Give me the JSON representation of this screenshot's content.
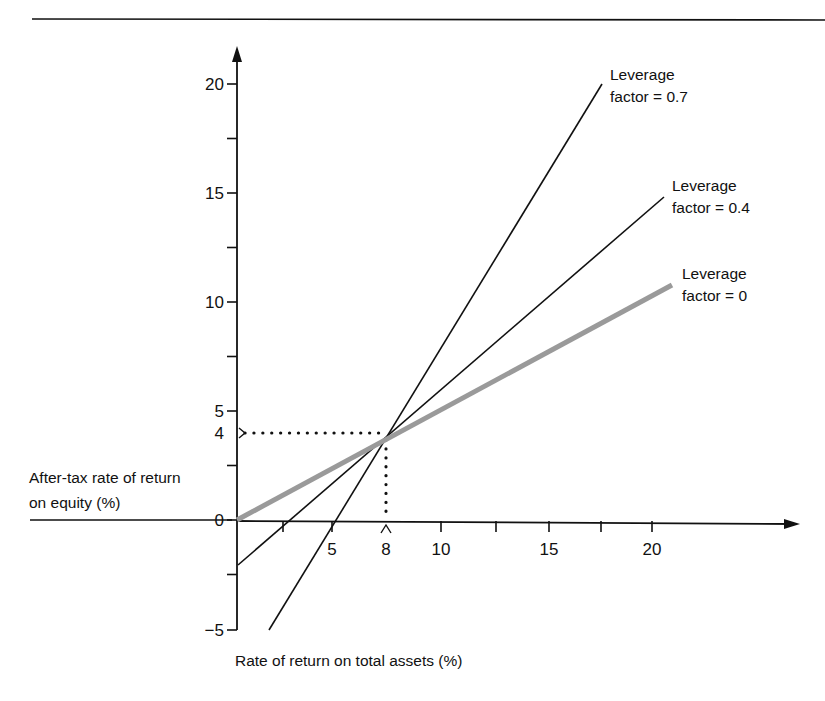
{
  "chart_data": {
    "type": "line",
    "title": "",
    "xlabel": "Rate of return on total assets (%)",
    "ylabel": "After-tax rate of return on equity (%)",
    "ylabel_lines": [
      "After-tax rate of return",
      "on equity (%)"
    ],
    "xlim": [
      0,
      23
    ],
    "ylim": [
      -5,
      21
    ],
    "x_ticks": [
      2.5,
      5,
      8,
      10,
      12.5,
      15,
      17.5,
      20
    ],
    "x_tick_labels": [
      {
        "value": 5,
        "label": "5"
      },
      {
        "value": 8,
        "label": "8"
      },
      {
        "value": 10,
        "label": "10"
      },
      {
        "value": 15,
        "label": "15"
      },
      {
        "value": 20,
        "label": "20"
      }
    ],
    "y_ticks": [
      -5,
      -2.5,
      0,
      2.5,
      4,
      5,
      7.5,
      10,
      12.5,
      15,
      17.5,
      20
    ],
    "y_tick_labels": [
      {
        "value": 20,
        "label": "20"
      },
      {
        "value": 15,
        "label": "15"
      },
      {
        "value": 10,
        "label": "10"
      },
      {
        "value": 5,
        "label": "5"
      },
      {
        "value": 4,
        "label": "4"
      },
      {
        "value": 0,
        "label": "0"
      },
      {
        "value": -5,
        "label": "−5"
      }
    ],
    "grid": false,
    "series": [
      {
        "name": "Leverage factor = 0.7",
        "label_lines": [
          "Leverage",
          "factor = 0.7"
        ],
        "color": "#111111",
        "width": 1.6,
        "x": [
          1.5,
          18.0
        ],
        "y": [
          -5.0,
          19.8
        ]
      },
      {
        "name": "Leverage factor = 0.4",
        "label_lines": [
          "Leverage",
          "factor = 0.4"
        ],
        "color": "#111111",
        "width": 1.6,
        "x": [
          0.0,
          20.5
        ],
        "y": [
          -2.0,
          14.8
        ]
      },
      {
        "name": "Leverage factor = 0",
        "label_lines": [
          "Leverage",
          "factor = 0"
        ],
        "color": "#9a9a9a",
        "width": 5,
        "x": [
          0.0,
          21.0
        ],
        "y": [
          0.0,
          10.5
        ]
      }
    ],
    "annotations": [
      {
        "type": "dotted-guide",
        "from": [
          0,
          4
        ],
        "to": [
          8,
          4
        ],
        "text": "4"
      },
      {
        "type": "dotted-guide",
        "from": [
          8,
          4
        ],
        "to": [
          8,
          0
        ],
        "text": "8"
      },
      {
        "type": "intersection",
        "point": [
          8,
          4
        ],
        "text": "All leverage lines intersect at (8, 4)"
      }
    ]
  }
}
